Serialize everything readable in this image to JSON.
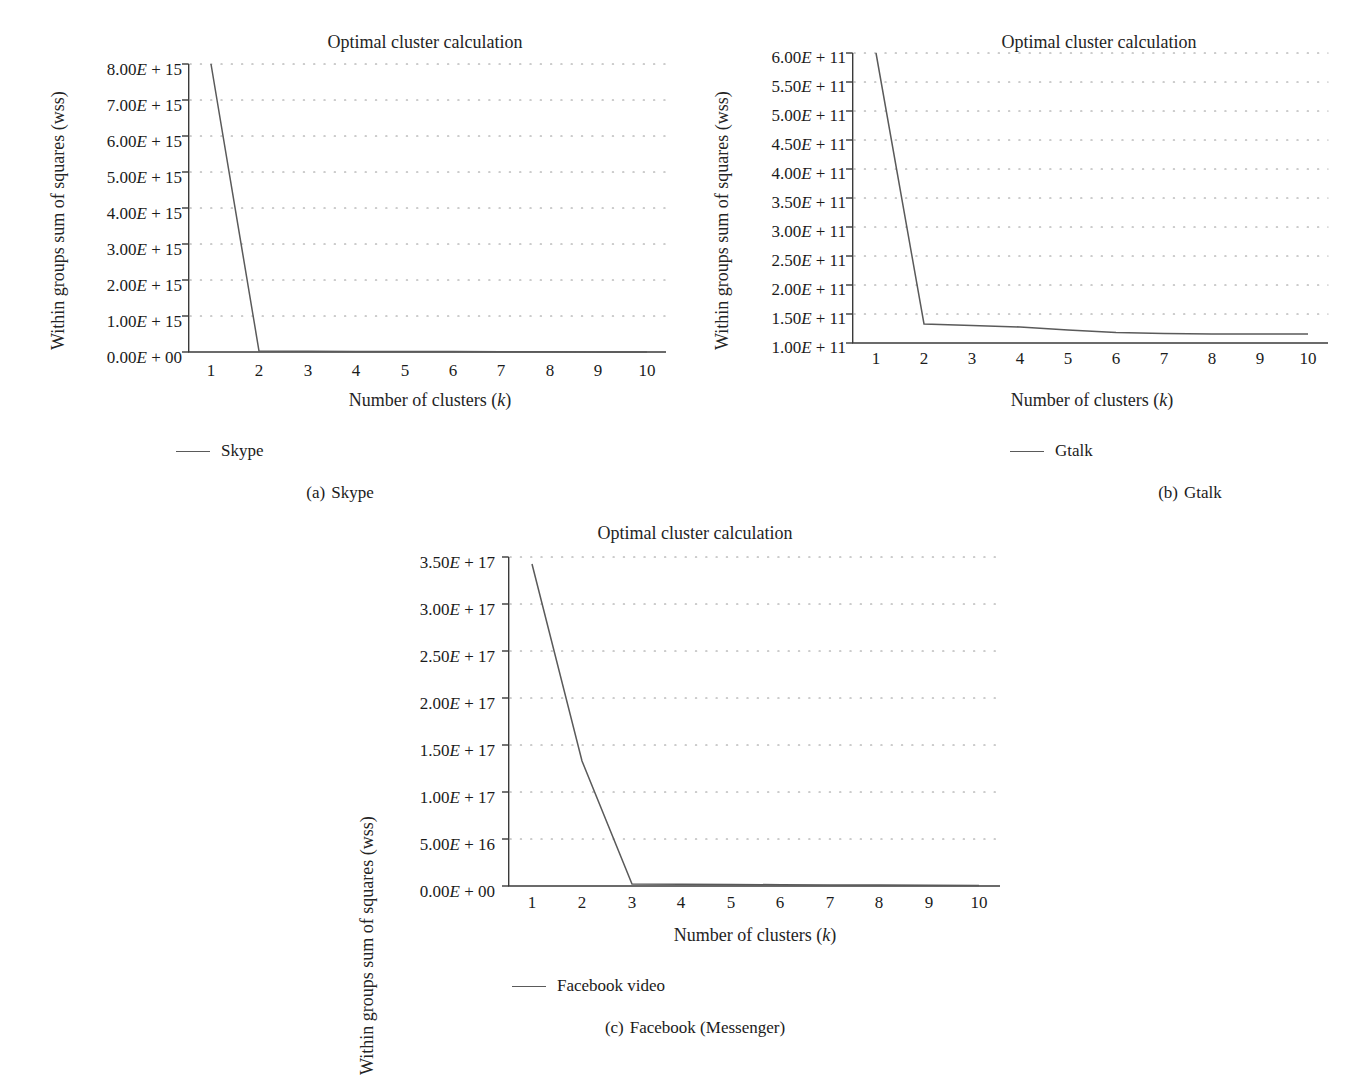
{
  "figure": {
    "background": "#ffffff",
    "line_color": "#5a5a5a",
    "axis_color": "#3a3a3a",
    "grid_color": "#9a9a9a",
    "text_color": "#1b1b1b"
  },
  "panels": [
    {
      "id": "a",
      "caption_index": "(a)",
      "caption_text": "Skype",
      "legend_label": "Skype",
      "title": "Optimal cluster calculation",
      "ylabel": "Within groups sum of squares (wss)",
      "xlabel_prefix": "Number of clusters (",
      "xlabel_italic": "k",
      "xlabel_suffix": ")",
      "yticks": [
        "0.00E + 00",
        "1.00E + 15",
        "2.00E + 15",
        "3.00E + 15",
        "4.00E + 15",
        "5.00E + 15",
        "6.00E + 15",
        "7.00E + 15",
        "8.00E + 15"
      ],
      "xticks": [
        "1",
        "2",
        "3",
        "4",
        "5",
        "6",
        "7",
        "8",
        "9",
        "10"
      ]
    },
    {
      "id": "b",
      "caption_index": "(b)",
      "caption_text": "Gtalk",
      "legend_label": "Gtalk",
      "title": "Optimal cluster calculation",
      "ylabel": "Within groups sum of squares (wss)",
      "xlabel_prefix": "Number of clusters (",
      "xlabel_italic": "k",
      "xlabel_suffix": ")",
      "yticks": [
        "1.00E + 11",
        "1.50E + 11",
        "2.00E + 11",
        "2.50E + 11",
        "3.00E + 11",
        "3.50E + 11",
        "4.00E + 11",
        "4.50E + 11",
        "5.00E + 11",
        "5.50E + 11",
        "6.00E + 11"
      ],
      "xticks": [
        "1",
        "2",
        "3",
        "4",
        "5",
        "6",
        "7",
        "8",
        "9",
        "10"
      ]
    },
    {
      "id": "c",
      "caption_index": "(c)",
      "caption_text": "Facebook (Messenger)",
      "legend_label": "Facebook video",
      "title": "Optimal cluster calculation",
      "ylabel": "Within groups sum of squares (wss)",
      "xlabel_prefix": "Number of clusters (",
      "xlabel_italic": "k",
      "xlabel_suffix": ")",
      "yticks": [
        "0.00E + 00",
        "5.00E + 16",
        "1.00E + 17",
        "1.50E + 17",
        "2.00E + 17",
        "2.50E + 17",
        "3.00E + 17",
        "3.50E + 17"
      ],
      "xticks": [
        "1",
        "2",
        "3",
        "4",
        "5",
        "6",
        "7",
        "8",
        "9",
        "10"
      ]
    }
  ],
  "chart_data": [
    {
      "type": "line",
      "panel": "a",
      "title": "Optimal cluster calculation",
      "subtitle": "(a) Skype",
      "xlabel": "Number of clusters (k)",
      "ylabel": "Within groups sum of squares (wss)",
      "legend": [
        "Skype"
      ],
      "legend_position": "below-left",
      "grid": true,
      "grid_style": "dotted-horizontal",
      "x": [
        1,
        2,
        3,
        4,
        5,
        6,
        7,
        8,
        9,
        10
      ],
      "xlim": [
        0.5,
        10.5
      ],
      "ylim": [
        0,
        8000000000000000.0
      ],
      "ytick_values": [
        0,
        1000000000000000.0,
        2000000000000000.0,
        3000000000000000.0,
        4000000000000000.0,
        5000000000000000.0,
        6000000000000000.0,
        7000000000000000.0,
        8000000000000000.0
      ],
      "series": [
        {
          "name": "Skype",
          "values": [
            8000000000000000.0,
            30000000000000.0,
            22000000000000.0,
            18000000000000.0,
            15000000000000.0,
            13000000000000.0,
            11000000000000.0,
            10000000000000.0,
            9000000000000.0,
            8000000000000.0
          ]
        }
      ]
    },
    {
      "type": "line",
      "panel": "b",
      "title": "Optimal cluster calculation",
      "subtitle": "(b) Gtalk",
      "xlabel": "Number of clusters (k)",
      "ylabel": "Within groups sum of squares (wss)",
      "legend": [
        "Gtalk"
      ],
      "legend_position": "below-center",
      "grid": true,
      "grid_style": "dotted-horizontal",
      "x": [
        1,
        2,
        3,
        4,
        5,
        6,
        7,
        8,
        9,
        10
      ],
      "xlim": [
        0.5,
        10.5
      ],
      "ylim": [
        100000000000.0,
        600000000000.0
      ],
      "ytick_values": [
        100000000000.0,
        150000000000.0,
        200000000000.0,
        250000000000.0,
        300000000000.0,
        350000000000.0,
        400000000000.0,
        450000000000.0,
        500000000000.0,
        550000000000.0,
        600000000000.0
      ],
      "series": [
        {
          "name": "Gtalk",
          "values": [
            600000000000.0,
            133000000000.0,
            131000000000.0,
            130000000000.0,
            127000000000.0,
            125000000000.0,
            124000000000.0,
            123000000000.0,
            123000000000.0,
            123000000000.0
          ]
        }
      ]
    },
    {
      "type": "line",
      "panel": "c",
      "title": "Optimal cluster calculation",
      "subtitle": "(c) Facebook (Messenger)",
      "xlabel": "Number of clusters (k)",
      "ylabel": "Within groups sum of squares (wss)",
      "legend": [
        "Facebook video"
      ],
      "legend_position": "below-left",
      "grid": true,
      "grid_style": "dotted-horizontal",
      "x": [
        1,
        2,
        3,
        4,
        5,
        6,
        7,
        8,
        9,
        10
      ],
      "xlim": [
        0.5,
        10.5
      ],
      "ylim": [
        0,
        3.5e+17
      ],
      "ytick_values": [
        0,
        5e+16,
        1e+17,
        1.5e+17,
        2e+17,
        2.5e+17,
        3e+17,
        3.5e+17
      ],
      "series": [
        {
          "name": "Facebook video",
          "values": [
            3.42e+17,
            1.33e+17,
            2000000000000000.0,
            1800000000000000.0,
            1600000000000000.0,
            1500000000000000.0,
            1400000000000000.0,
            1300000000000000.0,
            1200000000000000.0,
            1200000000000000.0
          ]
        }
      ]
    }
  ]
}
